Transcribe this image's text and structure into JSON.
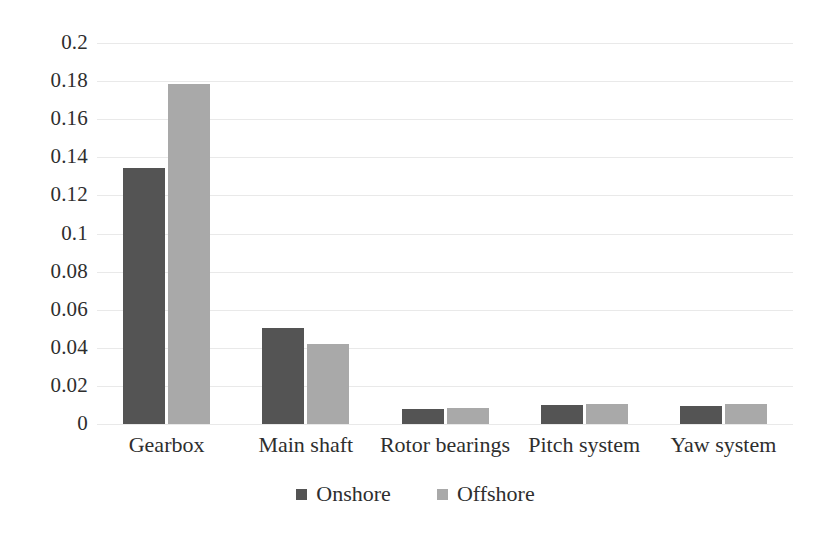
{
  "chart_data": {
    "type": "bar",
    "title": "",
    "subtitle": "",
    "xlabel": "",
    "ylabel": "",
    "categories": [
      "Gearbox",
      "Main shaft",
      "Rotor bearings",
      "Pitch system",
      "Yaw system"
    ],
    "series": [
      {
        "name": "Onshore",
        "color": "#545454",
        "values": [
          0.1345,
          0.0505,
          0.008,
          0.0102,
          0.0092
        ]
      },
      {
        "name": "Offshore",
        "color": "#a9a9a9",
        "values": [
          0.1785,
          0.0418,
          0.0085,
          0.0105,
          0.0104
        ]
      }
    ],
    "ylim": [
      0,
      0.2
    ],
    "ytick_values": [
      0,
      0.02,
      0.04,
      0.06,
      0.08,
      0.1,
      0.12,
      0.14,
      0.16,
      0.18,
      0.2
    ],
    "ytick_labels": [
      "0",
      "0.02",
      "0.04",
      "0.06",
      "0.08",
      "0.1",
      "0.12",
      "0.14",
      "0.16",
      "0.18",
      "0.2"
    ],
    "grid": true,
    "grid_axis": "y",
    "grid_color": "#e9e9e9",
    "legend": {
      "position": "bottom",
      "entries": [
        "Onshore",
        "Offshore"
      ]
    },
    "background_color": "#ffffff",
    "text_color": "#2e2e2e"
  }
}
